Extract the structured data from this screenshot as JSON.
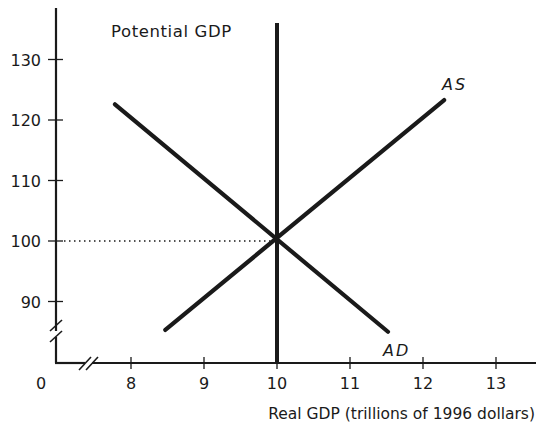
{
  "chart_data": {
    "type": "line",
    "title": "",
    "xlabel": "Real GDP (trillions of 1996 dollars)",
    "ylabel": "",
    "origin_label": "0",
    "xlim": [
      7,
      13.5
    ],
    "ylim": [
      80,
      137
    ],
    "x_ticks": [
      8,
      9,
      10,
      11,
      12,
      13
    ],
    "x_tick_labels": [
      "8",
      "9",
      "10",
      "11",
      "12",
      "13"
    ],
    "y_ticks": [
      90,
      100,
      110,
      120,
      130
    ],
    "y_tick_labels": [
      "90",
      "100",
      "110",
      "120",
      "130"
    ],
    "axis_breaks": {
      "x": true,
      "y": true
    },
    "grid": false,
    "series": [
      {
        "name": "AD",
        "label": "AD",
        "points": [
          [
            7.78,
            122.6
          ],
          [
            11.52,
            85.0
          ]
        ]
      },
      {
        "name": "AS",
        "label": "AS",
        "points": [
          [
            8.47,
            85.3
          ],
          [
            12.29,
            123.3
          ]
        ]
      },
      {
        "name": "Potential GDP",
        "label": "Potential GDP",
        "type": "vertical",
        "x": 10,
        "y_range": [
          80,
          136.5
        ]
      }
    ],
    "equilibrium": {
      "x": 10,
      "y": 100
    },
    "annotations": [
      {
        "text": "Potential GDP",
        "near": "top of vertical line at x=10"
      },
      {
        "text": "AS",
        "near": "upper end of AS curve"
      },
      {
        "text": "AD",
        "near": "lower end of AD curve"
      },
      {
        "text": "dotted guide line from y-axis at 100 to equilibrium point",
        "type": "dotted-line"
      }
    ]
  },
  "labels": {
    "potential_gdp": "Potential GDP",
    "as": "AS",
    "ad": "AD",
    "x_axis_title": "Real GDP (trillions of 1996 dollars)",
    "origin": "0"
  }
}
